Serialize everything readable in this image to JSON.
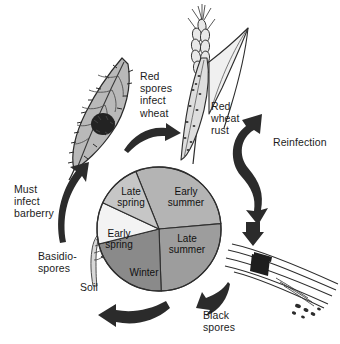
{
  "diagram": {
    "background_color": "#ffffff"
  },
  "cycle_wheel": {
    "name": "seasonal-cycle-pie",
    "center_x": 158,
    "center_y": 228,
    "radius": 62,
    "segments": [
      {
        "label": "Early\nsummer",
        "season": "early-summer",
        "color": "#9d9d9d",
        "start_deg": 355,
        "end_deg": 88,
        "label_x": 184,
        "label_y": 200
      },
      {
        "label": "Late\nsummer",
        "season": "late-summer",
        "color": "#8a8a8a",
        "start_deg": 88,
        "end_deg": 166,
        "label_x": 184,
        "label_y": 246
      },
      {
        "label": "Winter",
        "season": "winter",
        "color": "#f2f2f2",
        "start_deg": 166,
        "end_deg": 205,
        "label_x": 137,
        "label_y": 270
      },
      {
        "label": "Early\nspring",
        "season": "early-spring",
        "color": "#c6c6c6",
        "start_deg": 205,
        "end_deg": 248,
        "label_x": 116,
        "label_y": 236
      },
      {
        "label": "Late\nspring",
        "season": "late-spring",
        "color": "#b4b4b4",
        "start_deg": 248,
        "end_deg": 355,
        "label_x": 126,
        "label_y": 191
      }
    ]
  },
  "labels": {
    "red_spores_infect_wheat": "Red\nspores\ninfect\nwheat",
    "red_wheat_rust": "Red\nwheat\nrust",
    "reinfection": "Reinfection",
    "black_spores": "Black\nspores",
    "soil": "Soil",
    "basidiospores": "Basidio-\nspores",
    "must_infect_barberry": "Must\ninfect\nbarberry"
  },
  "illustrations": {
    "barberry_leaf": {
      "name": "barberry-leaf-illustration",
      "description": "serrated barberry leaf with dark aecia spot"
    },
    "wheat_stalk": {
      "name": "wheat-stalk-illustration",
      "description": "wheat ear with two leaves bearing red rust pustules"
    },
    "wheat_straw": {
      "name": "wheat-straw-illustration",
      "description": "straw stem with black telia spore mass"
    },
    "basidiospore_sprout": {
      "name": "basidiospore-sprout-illustration",
      "description": "germinating teliospore producing basidiospores"
    }
  },
  "arrows": {
    "leaf_to_wheat": "arrow-barberry-to-wheat",
    "reinfection_loop": "arrow-reinfection-double",
    "wheat_to_straw": "arrow-wheat-to-straw",
    "straw_to_soil": "arrow-black-spores-to-soil",
    "soil_to_leaf": "arrow-soil-to-barberry"
  },
  "colors": {
    "ink": "#1c1c1c",
    "arrow_fill": "#2b2b2b",
    "leaf_fill": "#b9b9b9",
    "wheat_fill": "#e0e0e0",
    "spot_dark": "#232323"
  }
}
